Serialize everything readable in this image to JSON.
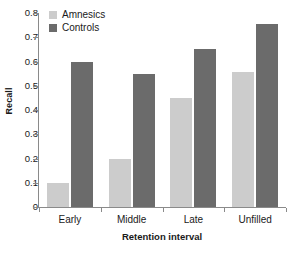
{
  "chart_data": {
    "type": "bar",
    "title": "",
    "subtitle": "",
    "xlabel": "Retention interval",
    "ylabel": "Recall",
    "categories": [
      "Early",
      "Middle",
      "Late",
      "Unfilled"
    ],
    "series": [
      {
        "name": "Amnesics",
        "color": "#cccccc",
        "values": [
          0.1,
          0.2,
          0.45,
          0.555
        ]
      },
      {
        "name": "Controls",
        "color": "#6b6b6b",
        "values": [
          0.6,
          0.55,
          0.65,
          0.755
        ]
      }
    ],
    "ylim": [
      0,
      0.8
    ],
    "ytick_values": [
      0.8,
      0.7,
      0.6,
      0.5,
      0.4,
      0.3,
      0.2,
      0.1,
      0
    ],
    "ytick_labels": [
      "0.8",
      "0.7",
      "0.6",
      "0.5",
      "0.4",
      "0.3",
      "0.2",
      "0.1",
      "0"
    ],
    "grid": false,
    "legend_position": "top-left",
    "legend_entries": [
      "Amnesics",
      "Controls"
    ]
  }
}
